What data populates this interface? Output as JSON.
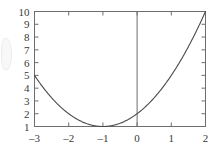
{
  "chart_data": {
    "type": "line",
    "title": "",
    "subtitle": "",
    "xlabel": "",
    "ylabel": "",
    "xlim": [
      -3,
      2
    ],
    "ylim": [
      1,
      10
    ],
    "grid": false,
    "legend": null,
    "expression": "y = x^2 + 2x + 2",
    "x_ticks": [
      -3,
      -2,
      -1,
      0,
      1,
      2
    ],
    "x_tick_labels": [
      "–3",
      "–2",
      "–1",
      "0",
      "1",
      "2"
    ],
    "y_ticks": [
      1,
      2,
      3,
      4,
      5,
      6,
      7,
      8,
      9,
      10
    ],
    "y_tick_labels": [
      "1",
      "2",
      "3",
      "4",
      "5",
      "6",
      "7",
      "8",
      "9",
      "10"
    ],
    "series": [
      {
        "name": "parabola",
        "color": "#4a4a4a",
        "x": [
          -3,
          -2.8,
          -2.6,
          -2.4,
          -2.2,
          -2,
          -1.8,
          -1.6,
          -1.4,
          -1.2,
          -1,
          -0.8,
          -0.6,
          -0.4,
          -0.2,
          0,
          0.2,
          0.4,
          0.6,
          0.8,
          1,
          1.2,
          1.4,
          1.6,
          1.8,
          2
        ],
        "values": [
          5,
          4.24,
          3.56,
          2.96,
          2.44,
          2,
          1.64,
          1.36,
          1.16,
          1.04,
          1,
          1.04,
          1.16,
          1.36,
          1.64,
          2,
          2.44,
          2.96,
          3.56,
          4.24,
          5,
          5.84,
          6.76,
          7.76,
          8.84,
          10
        ]
      }
    ],
    "annotations": [
      {
        "name": "vertical-axis-line",
        "at_x": 0,
        "description": "vertical line drawn at x = 0 spanning full plot height"
      }
    ],
    "key_points": {
      "vertex": [
        -1,
        1
      ],
      "y_intercept": [
        0,
        2
      ],
      "left_endpoint": [
        -3,
        5
      ],
      "right_endpoint": [
        2,
        10
      ]
    },
    "style": {
      "axis_color": "#6e6e6e",
      "curve_color": "#4a4a4a",
      "background": "#ffffff",
      "tick_direction": "in"
    }
  }
}
